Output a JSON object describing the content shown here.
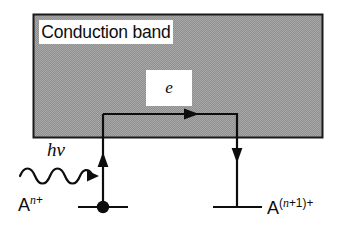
{
  "figure": {
    "type": "energy-band-diagram",
    "band": {
      "label": "Conduction band",
      "fill_color": "#999999",
      "border_color": "#1a1a1a",
      "rect": {
        "x": 33,
        "y": 14,
        "width": 290,
        "height": 124
      }
    },
    "electron": {
      "label": "e",
      "plate_color": "#ffffff"
    },
    "photon": {
      "label_h": "h",
      "label_nu": "ν",
      "wave_cycles": 3
    },
    "levels": [
      {
        "name": "donor-level",
        "species": "A",
        "superscript": "n+",
        "superscript_italic_part": "n",
        "superscript_plain_part": "+",
        "has_electron_dot": true,
        "line": {
          "x1": 78,
          "x2": 128,
          "y": 207
        }
      },
      {
        "name": "acceptor-level",
        "species": "A",
        "superscript": "(n+1)+",
        "superscript_italic_part": "n",
        "superscript_plain_part": "+1)+",
        "has_electron_dot": false,
        "line": {
          "x1": 213,
          "x2": 262,
          "y": 207
        }
      }
    ],
    "arrows": [
      {
        "name": "excitation-arrow",
        "direction": "up",
        "x": 103,
        "from_y": 207,
        "to_y": 113
      },
      {
        "name": "transport-arrow",
        "direction": "right",
        "y": 113,
        "from_x": 103,
        "to_x": 237
      },
      {
        "name": "capture-arrow",
        "direction": "down",
        "x": 237,
        "from_y": 113,
        "to_y": 207
      },
      {
        "name": "photon-arrow",
        "direction": "right",
        "y": 176,
        "from_x": 20,
        "to_x": 99
      }
    ],
    "colors": {
      "ink": "#0d0d0d",
      "band_gray": "#999999",
      "background": "#ffffff"
    }
  }
}
